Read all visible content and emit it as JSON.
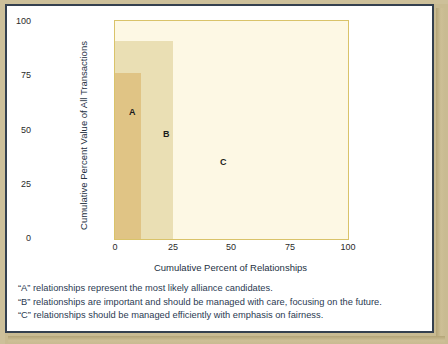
{
  "chart_data": {
    "type": "area",
    "title": "",
    "subtitle": "",
    "xlabel": "Cumulative Percent of Relationships",
    "ylabel": "Cumulative Percent Value of All Transactions",
    "xlim": [
      0,
      100
    ],
    "ylim": [
      0,
      100
    ],
    "xticks": [
      "0",
      "25",
      "50",
      "75",
      "100"
    ],
    "xtick_values": [
      0,
      25,
      50,
      75,
      100
    ],
    "yticks": [
      "0",
      "25",
      "50",
      "75",
      "100"
    ],
    "ytick_values": [
      0,
      25,
      50,
      75,
      100
    ],
    "grid": false,
    "legend": "none",
    "series": [
      {
        "name": "A",
        "label": "A",
        "x_start": 0,
        "x_end": 11,
        "y_start": 0,
        "y_end": 76,
        "color": "#e0c485"
      },
      {
        "name": "B",
        "label": "B",
        "x_start": 0,
        "x_end": 25,
        "y_start": 0,
        "y_end": 91,
        "color": "#eadfb4"
      },
      {
        "name": "C",
        "label": "C",
        "x_start": 0,
        "x_end": 100,
        "y_start": 0,
        "y_end": 100,
        "color": "#fdf8e4"
      }
    ],
    "annotations": [
      {
        "text": "A",
        "x": 6,
        "y": 60
      },
      {
        "text": "B",
        "x": 21,
        "y": 50
      },
      {
        "text": "C",
        "x": 45,
        "y": 37
      }
    ],
    "frame_color": "#d9c36a"
  },
  "caption": {
    "lines": [
      "“A” relationships represent the most likely alliance candidates.",
      "“B” relationships are important and should be managed with care, focusing on the future.",
      "“C” relationships should be managed efficiently with emphasis on fairness."
    ]
  },
  "colors": {
    "border": "#34404f",
    "page_background": "#c9bb92",
    "card_background": "#ffffff",
    "band_a": "#e0c485",
    "band_b": "#eadfb4",
    "band_c": "#fdf8e4",
    "axis_frame": "#d9c36a",
    "text": "#24303f"
  }
}
